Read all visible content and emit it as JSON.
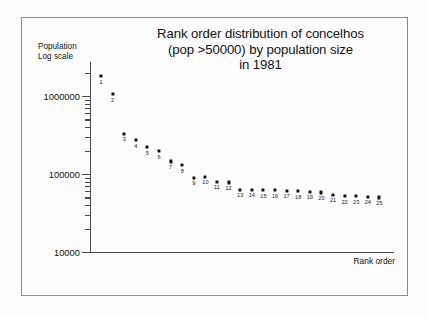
{
  "figure": {
    "title_lines": [
      "Rank order distribution of concelhos",
      "(pop >50000) by population size",
      "in 1981"
    ],
    "y_caption_lines": [
      "Population",
      "Log scale"
    ],
    "x_caption": "Rank order"
  },
  "chart_data": {
    "type": "scatter",
    "title": "Rank order distribution of concelhos (pop >50000) by population size in 1981",
    "xlabel": "Rank order",
    "ylabel": "Population (Log scale)",
    "yscale": "log",
    "ylim": [
      10000,
      3000000
    ],
    "ytick_labels": [
      "1000000",
      "100000",
      "10000"
    ],
    "ytick_values": [
      1000000,
      100000,
      10000
    ],
    "grid": false,
    "legend": false,
    "point_labels_shown": true,
    "x": [
      1,
      2,
      3,
      4,
      5,
      6,
      7,
      8,
      9,
      10,
      11,
      12,
      13,
      14,
      15,
      16,
      17,
      18,
      19,
      20,
      21,
      22,
      23,
      24,
      25
    ],
    "categories": [
      "1",
      "2",
      "3",
      "4",
      "5",
      "6",
      "7",
      "8",
      "9",
      "10",
      "11",
      "12",
      "13",
      "14",
      "15",
      "16",
      "17",
      "18",
      "19",
      "20",
      "21",
      "22",
      "23",
      "24",
      "25"
    ],
    "values": [
      1800000,
      1050000,
      330000,
      270000,
      220000,
      195000,
      145000,
      130000,
      90000,
      92000,
      80000,
      78000,
      63000,
      63000,
      62000,
      62000,
      61000,
      60000,
      59000,
      58000,
      54000,
      52000,
      52000,
      51000,
      50000
    ]
  }
}
